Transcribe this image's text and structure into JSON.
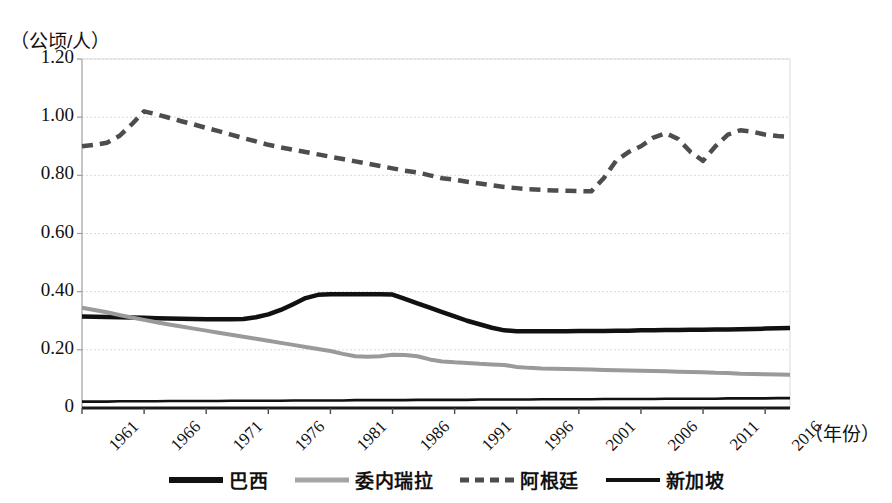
{
  "chart_data": {
    "type": "line",
    "title": "",
    "xlabel": "（年份）",
    "ylabel": "（公顷/人）",
    "xlim": [
      1961,
      2018
    ],
    "ylim": [
      0,
      1.2
    ],
    "grid": true,
    "legend_position": "bottom",
    "y_ticks": [
      "1.20",
      "1.00",
      "0.80",
      "0.60",
      "0.40",
      "0.20",
      "0"
    ],
    "y_tick_values": [
      1.2,
      1.0,
      0.8,
      0.6,
      0.4,
      0.2,
      0
    ],
    "x_ticks": [
      "1961",
      "1966",
      "1971",
      "1976",
      "1981",
      "1986",
      "1991",
      "1996",
      "2001",
      "2006",
      "2011",
      "2016"
    ],
    "x_tick_values": [
      1961,
      1966,
      1971,
      1976,
      1981,
      1986,
      1991,
      1996,
      2001,
      2006,
      2011,
      2016
    ],
    "x": [
      1961,
      1962,
      1963,
      1964,
      1965,
      1966,
      1967,
      1968,
      1969,
      1970,
      1971,
      1972,
      1973,
      1974,
      1975,
      1976,
      1977,
      1978,
      1979,
      1980,
      1981,
      1982,
      1983,
      1984,
      1985,
      1986,
      1987,
      1988,
      1989,
      1990,
      1991,
      1992,
      1993,
      1994,
      1995,
      1996,
      1997,
      1998,
      1999,
      2000,
      2001,
      2002,
      2003,
      2004,
      2005,
      2006,
      2007,
      2008,
      2009,
      2010,
      2011,
      2012,
      2013,
      2014,
      2015,
      2016,
      2017,
      2018
    ],
    "series": [
      {
        "name": "巴西",
        "color": "#111111",
        "style": "solid",
        "width": 4.5,
        "values": [
          0.315,
          0.314,
          0.313,
          0.312,
          0.311,
          0.31,
          0.309,
          0.308,
          0.307,
          0.306,
          0.305,
          0.305,
          0.305,
          0.306,
          0.312,
          0.322,
          0.337,
          0.357,
          0.378,
          0.389,
          0.391,
          0.391,
          0.391,
          0.391,
          0.391,
          0.39,
          0.375,
          0.36,
          0.345,
          0.33,
          0.315,
          0.3,
          0.288,
          0.276,
          0.267,
          0.264,
          0.264,
          0.264,
          0.264,
          0.264,
          0.265,
          0.265,
          0.265,
          0.266,
          0.266,
          0.267,
          0.267,
          0.268,
          0.268,
          0.269,
          0.269,
          0.27,
          0.27,
          0.271,
          0.272,
          0.273,
          0.274,
          0.275
        ]
      },
      {
        "name": "委内瑞拉",
        "color": "#9a9a9a",
        "style": "solid",
        "width": 4.0,
        "values": [
          0.345,
          0.337,
          0.329,
          0.32,
          0.311,
          0.303,
          0.295,
          0.287,
          0.28,
          0.273,
          0.266,
          0.259,
          0.252,
          0.245,
          0.238,
          0.231,
          0.224,
          0.217,
          0.21,
          0.203,
          0.196,
          0.186,
          0.178,
          0.176,
          0.178,
          0.183,
          0.182,
          0.178,
          0.167,
          0.16,
          0.157,
          0.155,
          0.152,
          0.15,
          0.148,
          0.141,
          0.138,
          0.136,
          0.135,
          0.134,
          0.133,
          0.132,
          0.131,
          0.13,
          0.129,
          0.128,
          0.127,
          0.126,
          0.125,
          0.124,
          0.123,
          0.121,
          0.12,
          0.118,
          0.117,
          0.116,
          0.115,
          0.114
        ]
      },
      {
        "name": "阿根廷",
        "color": "#4d4d4d",
        "style": "dashed",
        "width": 4.5,
        "values": [
          0.9,
          0.905,
          0.912,
          0.935,
          0.975,
          1.02,
          1.01,
          0.998,
          0.986,
          0.975,
          0.963,
          0.952,
          0.94,
          0.928,
          0.917,
          0.905,
          0.896,
          0.888,
          0.88,
          0.872,
          0.864,
          0.856,
          0.848,
          0.84,
          0.832,
          0.824,
          0.816,
          0.81,
          0.8,
          0.79,
          0.785,
          0.778,
          0.772,
          0.766,
          0.76,
          0.756,
          0.752,
          0.75,
          0.748,
          0.747,
          0.746,
          0.745,
          0.79,
          0.85,
          0.88,
          0.9,
          0.93,
          0.945,
          0.925,
          0.88,
          0.85,
          0.9,
          0.94,
          0.955,
          0.95,
          0.94,
          0.935,
          0.932
        ]
      },
      {
        "name": "新加坡",
        "color": "#111111",
        "style": "solid",
        "width": 2.6,
        "values": [
          0.022,
          0.022,
          0.022,
          0.023,
          0.023,
          0.023,
          0.023,
          0.024,
          0.024,
          0.024,
          0.024,
          0.024,
          0.025,
          0.025,
          0.025,
          0.025,
          0.025,
          0.026,
          0.026,
          0.026,
          0.026,
          0.026,
          0.027,
          0.027,
          0.027,
          0.027,
          0.027,
          0.028,
          0.028,
          0.028,
          0.028,
          0.028,
          0.029,
          0.029,
          0.029,
          0.029,
          0.029,
          0.03,
          0.03,
          0.03,
          0.03,
          0.03,
          0.031,
          0.031,
          0.031,
          0.031,
          0.031,
          0.032,
          0.032,
          0.032,
          0.032,
          0.032,
          0.033,
          0.033,
          0.033,
          0.033,
          0.034,
          0.034
        ]
      }
    ]
  },
  "axes": {
    "y_title": "（公顷/人）",
    "x_title": "（年份）"
  },
  "legend": {
    "items": [
      {
        "label": "巴西",
        "color": "#111111",
        "style": "solid",
        "thickness": 6
      },
      {
        "label": "委内瑞拉",
        "color": "#a5a5a5",
        "style": "solid",
        "thickness": 5
      },
      {
        "label": "阿根廷",
        "color": "#4d4d4d",
        "style": "dashed",
        "thickness": 5
      },
      {
        "label": "新加坡",
        "color": "#111111",
        "style": "solid",
        "thickness": 4
      }
    ]
  },
  "colors": {
    "grid": "#d9d9d9",
    "axis": "#9e9e9e",
    "background": "#ffffff"
  }
}
